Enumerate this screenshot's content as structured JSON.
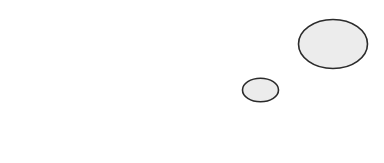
{
  "diagram": {
    "shapes": [
      {
        "name": "large-ellipse",
        "fill": "#ececec",
        "stroke": "#2b2b2b"
      },
      {
        "name": "small-ellipse",
        "fill": "#ececec",
        "stroke": "#2b2b2b"
      }
    ]
  }
}
